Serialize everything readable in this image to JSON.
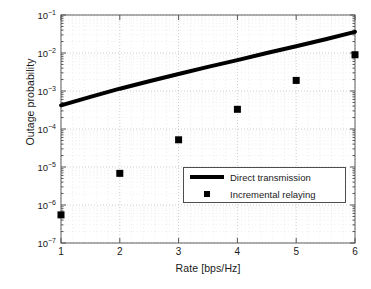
{
  "chart_data": {
    "type": "line",
    "title": "",
    "xlabel": "Rate [bps/Hz]",
    "ylabel": "Outage probability",
    "xlim": [
      1,
      6
    ],
    "ylim": [
      1e-07,
      0.1
    ],
    "yscale": "log",
    "xscale": "linear",
    "grid": true,
    "grid_style": "dotted-minor-log",
    "legend_position": "lower-right-inside",
    "xticks": [
      1,
      2,
      3,
      4,
      5,
      6
    ],
    "xtick_labels": [
      "1",
      "2",
      "3",
      "4",
      "5",
      "6"
    ],
    "yticks": [
      1e-07,
      1e-06,
      1e-05,
      0.0001,
      0.001,
      0.01,
      0.1
    ],
    "ytick_labels": [
      "10-7",
      "10-6",
      "10-5",
      "10-4",
      "10-3",
      "10-2",
      "10-1"
    ],
    "ytick_mantissa": "10",
    "ytick_exponents": [
      "-7",
      "-6",
      "-5",
      "-4",
      "-3",
      "-2",
      "-1"
    ],
    "series": [
      {
        "name": "Direct transmission",
        "type": "line",
        "color": "#000000",
        "linewidth": 4,
        "x": [
          1,
          1.5,
          2,
          2.5,
          3,
          3.5,
          4,
          4.5,
          5,
          5.5,
          6
        ],
        "values": [
          0.00042,
          0.0007,
          0.00115,
          0.0018,
          0.0028,
          0.0043,
          0.0065,
          0.01,
          0.015,
          0.023,
          0.036
        ]
      },
      {
        "name": "Incremental relaying",
        "type": "scatter",
        "color": "#000000",
        "marker": "square",
        "markersize": 7,
        "x": [
          1,
          2,
          3,
          4,
          5,
          6
        ],
        "values": [
          5.5e-07,
          6.8e-06,
          5.2e-05,
          0.00033,
          0.0019,
          0.009
        ]
      }
    ]
  },
  "legend": {
    "entries": [
      {
        "label": "Direct transmission",
        "symbol": "line"
      },
      {
        "label": "Incremental relaying",
        "symbol": "square-marker"
      }
    ]
  }
}
